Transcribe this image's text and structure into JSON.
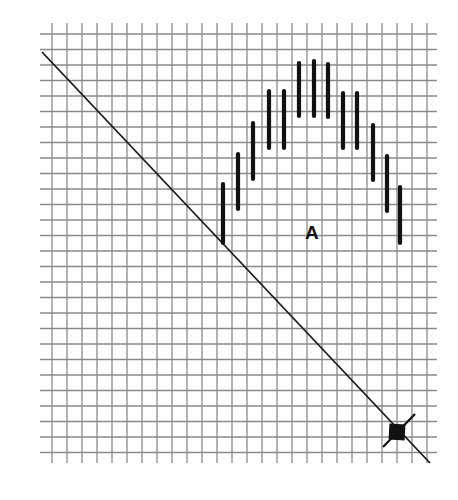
{
  "diagram": {
    "type": "grid-plot",
    "grid": {
      "vertical_lines_x_start": 52,
      "vertical_line_spacing": 15,
      "vertical_line_count": 26,
      "vertical_line_y_range": [
        23,
        463
      ],
      "horizontal_lines_y_start": 34,
      "horizontal_line_spacing": 15.5,
      "horizontal_line_count": 28,
      "horizontal_line_x_range": [
        40,
        437
      ],
      "color": "#8a8a8a"
    },
    "diagonal_line": {
      "from": [
        42,
        52
      ],
      "to": [
        430,
        463
      ],
      "color": "#1a1a1a"
    },
    "bars": [
      {
        "x": 223,
        "y1": 184,
        "y2": 243
      },
      {
        "x": 238,
        "y1": 154,
        "y2": 209
      },
      {
        "x": 253,
        "y1": 123,
        "y2": 179
      },
      {
        "x": 269,
        "y1": 91,
        "y2": 148
      },
      {
        "x": 284,
        "y1": 91,
        "y2": 148
      },
      {
        "x": 299,
        "y1": 63,
        "y2": 116
      },
      {
        "x": 314,
        "y1": 61,
        "y2": 116
      },
      {
        "x": 328,
        "y1": 64,
        "y2": 117
      },
      {
        "x": 343,
        "y1": 93,
        "y2": 148
      },
      {
        "x": 357,
        "y1": 93,
        "y2": 148
      },
      {
        "x": 373,
        "y1": 125,
        "y2": 180
      },
      {
        "x": 387,
        "y1": 156,
        "y2": 211
      },
      {
        "x": 400,
        "y1": 187,
        "y2": 243
      }
    ],
    "marker": {
      "shape": "square",
      "center": [
        397,
        432
      ],
      "size": 16,
      "cross_line": {
        "from": [
          383,
          447
        ],
        "to": [
          415,
          414
        ]
      },
      "color": "#111111"
    },
    "label": {
      "text": "A",
      "x": 312,
      "y": 232
    }
  }
}
